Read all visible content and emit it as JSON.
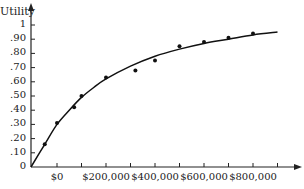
{
  "chart_data": {
    "type": "scatter",
    "title": "",
    "xlabel": "",
    "ylabel": "Utility",
    "x_tick_labels": [
      "$0",
      "$200,000",
      "$400,000",
      "$600,000",
      "$800,000"
    ],
    "x_tick_values": [
      0,
      200000,
      400000,
      600000,
      800000
    ],
    "x_minor_tick_step": 100000,
    "y_tick_labels": [
      "0",
      ".10",
      ".20",
      ".30",
      ".40",
      ".50",
      ".60",
      ".70",
      ".80",
      ".90",
      "1"
    ],
    "y_tick_values": [
      0,
      0.1,
      0.2,
      0.3,
      0.4,
      0.5,
      0.6,
      0.7,
      0.8,
      0.9,
      1.0
    ],
    "xlim": [
      -100000,
      950000
    ],
    "ylim": [
      0,
      1.05
    ],
    "grid": false,
    "legend": null,
    "series": [
      {
        "name": "assessed points",
        "type": "scatter",
        "x": [
          -50000,
          0,
          70000,
          100000,
          200000,
          320000,
          400000,
          500000,
          600000,
          700000,
          800000
        ],
        "y": [
          0.16,
          0.31,
          0.42,
          0.5,
          0.63,
          0.68,
          0.75,
          0.85,
          0.88,
          0.91,
          0.94
        ]
      },
      {
        "name": "fitted utility curve",
        "type": "line",
        "x": [
          -100000,
          -50000,
          0,
          50000,
          100000,
          150000,
          200000,
          300000,
          400000,
          500000,
          600000,
          700000,
          800000,
          900000
        ],
        "y": [
          0.0,
          0.16,
          0.3,
          0.4,
          0.49,
          0.56,
          0.62,
          0.71,
          0.78,
          0.83,
          0.87,
          0.9,
          0.93,
          0.95
        ]
      }
    ]
  }
}
